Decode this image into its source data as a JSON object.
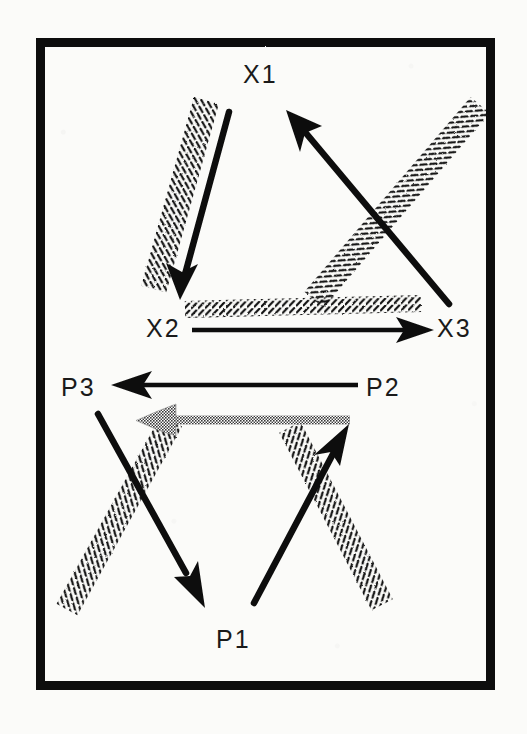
{
  "figure": {
    "title": "",
    "background_color": "#fbfbf9",
    "ink_color": "#111111",
    "gray_arrow_color": "#8c8c8c",
    "frame": {
      "x": 36,
      "y": 38,
      "width": 459,
      "height": 652,
      "border_width": 9,
      "dividers_y": [
        265,
        361,
        456
      ]
    },
    "bands": [
      {
        "name": "band-upper",
        "top": 38,
        "bottom": 265
      },
      {
        "name": "band-x-axis",
        "top": 265,
        "bottom": 361
      },
      {
        "name": "band-p-axis",
        "top": 361,
        "bottom": 456
      },
      {
        "name": "band-lower",
        "top": 456,
        "bottom": 690
      }
    ]
  },
  "nodes": [
    {
      "id": "X1",
      "label": "X1",
      "x": 258,
      "y": 75,
      "group": "X"
    },
    {
      "id": "X2",
      "label": "X2",
      "x": 163,
      "y": 329,
      "group": "X"
    },
    {
      "id": "X3",
      "label": "X3",
      "x": 454,
      "y": 329,
      "group": "X"
    },
    {
      "id": "P3",
      "label": "P3",
      "x": 78,
      "y": 388,
      "group": "P"
    },
    {
      "id": "P2",
      "label": "P2",
      "x": 383,
      "y": 388,
      "group": "P"
    },
    {
      "id": "P1",
      "label": "P1",
      "x": 233,
      "y": 640,
      "group": "P"
    }
  ],
  "arrows": [
    {
      "name": "arrow-x1-to-x2",
      "from": "X1",
      "to": "X2",
      "style": "solid-black",
      "x1": 228,
      "y1": 112,
      "x2": 180,
      "y2": 296
    },
    {
      "name": "arrow-x2-to-x3",
      "from": "X2",
      "to": "X3",
      "style": "solid-black",
      "x1": 192,
      "y1": 330,
      "x2": 432,
      "y2": 330
    },
    {
      "name": "arrow-x3-to-x1",
      "from": "X3",
      "to": "X1",
      "style": "solid-black",
      "x1": 448,
      "y1": 303,
      "x2": 288,
      "y2": 112
    },
    {
      "name": "arrow-p2-to-p3",
      "from": "P2",
      "to": "P3",
      "style": "solid-black",
      "x1": 360,
      "y1": 385,
      "x2": 112,
      "y2": 385
    },
    {
      "name": "arrow-p2-to-p3-ghost",
      "from": "P2",
      "to": "P3",
      "style": "gray-dithered",
      "x1": 350,
      "y1": 421,
      "x2": 138,
      "y2": 421
    },
    {
      "name": "arrow-p3-to-p1",
      "from": "P3",
      "to": "P1",
      "style": "solid-black",
      "x1": 97,
      "y1": 414,
      "x2": 203,
      "y2": 607
    },
    {
      "name": "arrow-p1-to-p2",
      "from": "P1",
      "to": "P2",
      "style": "solid-black",
      "x1": 253,
      "y1": 604,
      "x2": 348,
      "y2": 428
    }
  ],
  "hatch_bands": [
    {
      "name": "hatch-band-x1-x2",
      "along": "arrow-x1-to-x2",
      "x1": 208,
      "y1": 100,
      "x2": 155,
      "y2": 290,
      "side": "left"
    },
    {
      "name": "hatch-band-x2-x3",
      "along": "arrow-x2-to-x3",
      "x1": 186,
      "y1": 310,
      "x2": 420,
      "y2": 304,
      "side": "above"
    },
    {
      "name": "hatch-band-x3-x1",
      "along": "arrow-x3-to-x1",
      "x1": 470,
      "y1": 290,
      "x2": 300,
      "y2": 95,
      "side": "right"
    },
    {
      "name": "hatch-band-p3-p1",
      "along": "arrow-p3-to-p1",
      "x1": 70,
      "y1": 425,
      "x2": 172,
      "y2": 608,
      "side": "left"
    },
    {
      "name": "hatch-band-p1-p2",
      "along": "arrow-p1-to-p2",
      "x1": 290,
      "y1": 605,
      "x2": 382,
      "y2": 428,
      "side": "right"
    }
  ],
  "legend": {
    "solid_arrow_meaning": "",
    "hatched_band_meaning": "",
    "gray_arrow_meaning": ""
  }
}
